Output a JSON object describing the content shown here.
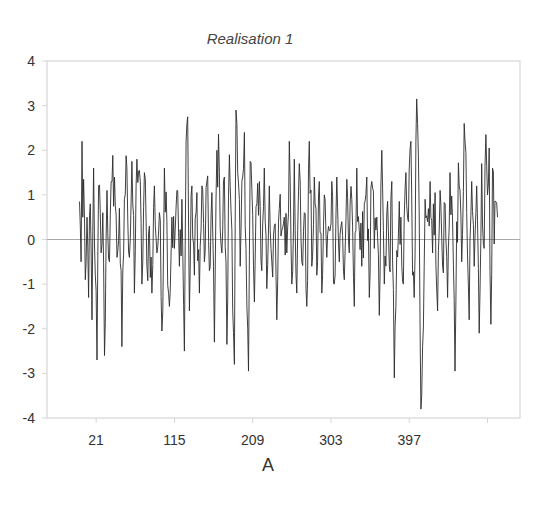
{
  "chart_data": {
    "type": "line",
    "title": "Realisation 1",
    "xlabel": "A",
    "ylabel": "",
    "ylim": [
      -4,
      4
    ],
    "yticks": [
      4,
      3,
      2,
      1,
      0,
      -1,
      -2,
      -3,
      -4
    ],
    "xticks": [
      21,
      115,
      209,
      303,
      397
    ],
    "x_unlabeled_tick_after": 491,
    "xlim": [
      -38,
      530
    ],
    "n_points": 490,
    "grid": {
      "zero_line": true,
      "other": false
    },
    "legend": null,
    "series": [
      {
        "name": "Realisation 1",
        "color": "#2b2b2b",
        "description": "Noisy stationary time series oscillating around 0, roughly in range -3.8 to 3.15",
        "anchors": [
          {
            "x": 1,
            "y": 0.85
          },
          {
            "x": 2,
            "y": 0.3
          },
          {
            "x": 3,
            "y": -0.5
          },
          {
            "x": 4,
            "y": 2.2
          },
          {
            "x": 5,
            "y": 0.5
          },
          {
            "x": 6,
            "y": 1.35
          },
          {
            "x": 8,
            "y": -0.9
          },
          {
            "x": 10,
            "y": 0.5
          },
          {
            "x": 12,
            "y": -1.3
          },
          {
            "x": 14,
            "y": 0.8
          },
          {
            "x": 16,
            "y": -1.8
          },
          {
            "x": 18,
            "y": 1.6
          },
          {
            "x": 20,
            "y": -0.8
          },
          {
            "x": 22,
            "y": -2.7
          },
          {
            "x": 24,
            "y": 1.2
          },
          {
            "x": 27,
            "y": -0.3
          },
          {
            "x": 29,
            "y": 0.6
          },
          {
            "x": 31,
            "y": -2.6
          },
          {
            "x": 34,
            "y": 1.1
          },
          {
            "x": 37,
            "y": -0.5
          },
          {
            "x": 40,
            "y": 1.3
          },
          {
            "x": 43,
            "y": 1.4
          },
          {
            "x": 46,
            "y": -0.4
          },
          {
            "x": 49,
            "y": 0.7
          },
          {
            "x": 52,
            "y": -2.4
          },
          {
            "x": 55,
            "y": 0.9
          },
          {
            "x": 58,
            "y": 1.6
          },
          {
            "x": 61,
            "y": -0.4
          },
          {
            "x": 64,
            "y": 1.75
          },
          {
            "x": 67,
            "y": -1.2
          },
          {
            "x": 70,
            "y": 1.8
          },
          {
            "x": 73,
            "y": 1.55
          },
          {
            "x": 76,
            "y": -1.0
          },
          {
            "x": 79,
            "y": 1.5
          },
          {
            "x": 82,
            "y": -0.6
          },
          {
            "x": 85,
            "y": 0.3
          },
          {
            "x": 88,
            "y": -1.2
          },
          {
            "x": 91,
            "y": 1.2
          },
          {
            "x": 94,
            "y": -0.3
          },
          {
            "x": 97,
            "y": 0.6
          },
          {
            "x": 100,
            "y": -2.05
          },
          {
            "x": 103,
            "y": 1.6
          },
          {
            "x": 106,
            "y": 0.4
          },
          {
            "x": 109,
            "y": -1.5
          },
          {
            "x": 112,
            "y": 0.5
          },
          {
            "x": 115,
            "y": -0.2
          },
          {
            "x": 118,
            "y": 1.1
          },
          {
            "x": 121,
            "y": -0.6
          },
          {
            "x": 124,
            "y": 0.9
          },
          {
            "x": 127,
            "y": -2.5
          },
          {
            "x": 129,
            "y": 2.2
          },
          {
            "x": 131,
            "y": 2.75
          },
          {
            "x": 133,
            "y": -1.6
          },
          {
            "x": 136,
            "y": 1.2
          },
          {
            "x": 139,
            "y": -0.8
          },
          {
            "x": 142,
            "y": 1.05
          },
          {
            "x": 145,
            "y": -1.2
          },
          {
            "x": 148,
            "y": 1.2
          },
          {
            "x": 151,
            "y": -0.5
          },
          {
            "x": 154,
            "y": 1.3
          },
          {
            "x": 157,
            "y": -0.7
          },
          {
            "x": 160,
            "y": 1.05
          },
          {
            "x": 163,
            "y": -2.3
          },
          {
            "x": 166,
            "y": 2.0
          },
          {
            "x": 169,
            "y": 1.5
          },
          {
            "x": 172,
            "y": -0.3
          },
          {
            "x": 175,
            "y": 1.4
          },
          {
            "x": 178,
            "y": -2.35
          },
          {
            "x": 181,
            "y": 1.9
          },
          {
            "x": 184,
            "y": 0.2
          },
          {
            "x": 187,
            "y": -2.8
          },
          {
            "x": 189,
            "y": 2.9
          },
          {
            "x": 191,
            "y": 1.5
          },
          {
            "x": 194,
            "y": -0.6
          },
          {
            "x": 197,
            "y": 1.4
          },
          {
            "x": 199,
            "y": 2.4
          },
          {
            "x": 201,
            "y": -0.2
          },
          {
            "x": 204,
            "y": -2.95
          },
          {
            "x": 206,
            "y": 1.75
          },
          {
            "x": 208,
            "y": 1.1
          },
          {
            "x": 211,
            "y": -1.4
          },
          {
            "x": 214,
            "y": 0.8
          },
          {
            "x": 217,
            "y": 1.3
          },
          {
            "x": 220,
            "y": -0.7
          },
          {
            "x": 223,
            "y": 1.6
          },
          {
            "x": 226,
            "y": -1.1
          },
          {
            "x": 229,
            "y": 1.2
          },
          {
            "x": 232,
            "y": -0.5
          },
          {
            "x": 235,
            "y": 0.3
          },
          {
            "x": 238,
            "y": -1.8
          },
          {
            "x": 241,
            "y": 0.7
          },
          {
            "x": 244,
            "y": 0.2
          },
          {
            "x": 247,
            "y": 0.5
          },
          {
            "x": 250,
            "y": -0.3
          },
          {
            "x": 253,
            "y": 2.2
          },
          {
            "x": 256,
            "y": -1.0
          },
          {
            "x": 259,
            "y": 1.8
          },
          {
            "x": 262,
            "y": -1.2
          },
          {
            "x": 265,
            "y": 1.7
          },
          {
            "x": 268,
            "y": -0.5
          },
          {
            "x": 271,
            "y": 0.6
          },
          {
            "x": 274,
            "y": -1.5
          },
          {
            "x": 277,
            "y": 2.2
          },
          {
            "x": 280,
            "y": -0.6
          },
          {
            "x": 283,
            "y": 1.4
          },
          {
            "x": 286,
            "y": -0.8
          },
          {
            "x": 289,
            "y": 1.3
          },
          {
            "x": 292,
            "y": -1.2
          },
          {
            "x": 295,
            "y": 1.0
          },
          {
            "x": 298,
            "y": -0.4
          },
          {
            "x": 301,
            "y": 0.2
          },
          {
            "x": 304,
            "y": 1.3
          },
          {
            "x": 307,
            "y": -1.0
          },
          {
            "x": 310,
            "y": 1.4
          },
          {
            "x": 313,
            "y": -0.5
          },
          {
            "x": 316,
            "y": 0.4
          },
          {
            "x": 319,
            "y": -0.9
          },
          {
            "x": 322,
            "y": 1.35
          },
          {
            "x": 325,
            "y": -0.3
          },
          {
            "x": 328,
            "y": 0.9
          },
          {
            "x": 331,
            "y": -1.5
          },
          {
            "x": 334,
            "y": 1.6
          },
          {
            "x": 337,
            "y": 0.2
          },
          {
            "x": 340,
            "y": -0.6
          },
          {
            "x": 343,
            "y": 0.8
          },
          {
            "x": 346,
            "y": 1.4
          },
          {
            "x": 349,
            "y": -1.3
          },
          {
            "x": 352,
            "y": 1.3
          },
          {
            "x": 355,
            "y": -0.2
          },
          {
            "x": 358,
            "y": 0.5
          },
          {
            "x": 361,
            "y": -1.7
          },
          {
            "x": 364,
            "y": 2.0
          },
          {
            "x": 367,
            "y": -1.0
          },
          {
            "x": 370,
            "y": 0.6
          },
          {
            "x": 373,
            "y": -0.6
          },
          {
            "x": 376,
            "y": 1.3
          },
          {
            "x": 379,
            "y": -3.1
          },
          {
            "x": 381,
            "y": -1.5
          },
          {
            "x": 384,
            "y": 0.1
          },
          {
            "x": 387,
            "y": 0.5
          },
          {
            "x": 390,
            "y": -1.0
          },
          {
            "x": 393,
            "y": 1.5
          },
          {
            "x": 396,
            "y": 0.4
          },
          {
            "x": 399,
            "y": 2.2
          },
          {
            "x": 401,
            "y": -0.8
          },
          {
            "x": 403,
            "y": -1.3
          },
          {
            "x": 406,
            "y": 3.15
          },
          {
            "x": 409,
            "y": 0.6
          },
          {
            "x": 411,
            "y": -3.8
          },
          {
            "x": 413,
            "y": -2.4
          },
          {
            "x": 416,
            "y": 0.9
          },
          {
            "x": 419,
            "y": 0.4
          },
          {
            "x": 422,
            "y": 1.3
          },
          {
            "x": 425,
            "y": -0.3
          },
          {
            "x": 428,
            "y": 1.05
          },
          {
            "x": 431,
            "y": -1.6
          },
          {
            "x": 434,
            "y": 1.1
          },
          {
            "x": 437,
            "y": -0.6
          },
          {
            "x": 440,
            "y": 0.8
          },
          {
            "x": 443,
            "y": -1.3
          },
          {
            "x": 446,
            "y": 1.5
          },
          {
            "x": 449,
            "y": 0.5
          },
          {
            "x": 452,
            "y": -2.95
          },
          {
            "x": 454,
            "y": 0.4
          },
          {
            "x": 457,
            "y": 1.2
          },
          {
            "x": 460,
            "y": -0.5
          },
          {
            "x": 463,
            "y": 2.6
          },
          {
            "x": 466,
            "y": 0.6
          },
          {
            "x": 469,
            "y": -1.8
          },
          {
            "x": 472,
            "y": 1.3
          },
          {
            "x": 475,
            "y": -0.6
          },
          {
            "x": 478,
            "y": 1.2
          },
          {
            "x": 481,
            "y": -2.1
          },
          {
            "x": 484,
            "y": 1.7
          },
          {
            "x": 487,
            "y": -0.2
          },
          {
            "x": 489,
            "y": 2.35
          },
          {
            "x": 491,
            "y": 1.0
          },
          {
            "x": 493,
            "y": 2.05
          },
          {
            "x": 495,
            "y": -1.9
          },
          {
            "x": 497,
            "y": 1.6
          },
          {
            "x": 499,
            "y": -0.1
          },
          {
            "x": 501,
            "y": 0.85
          },
          {
            "x": 503,
            "y": 0.5
          }
        ]
      }
    ],
    "colors": {
      "line": "#2b2b2b",
      "frame": "#d6d6d6",
      "zero_line": "#a8a8a8",
      "tick_text": "#333333"
    }
  }
}
